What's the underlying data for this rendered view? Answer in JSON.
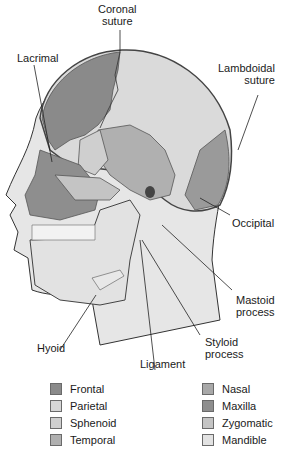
{
  "labels": {
    "coronal": "Coronal",
    "coronal2": "suture",
    "lacrimal": "Lacrimal",
    "lambdoidal": "Lambdoidal",
    "lambdoidal2": "suture",
    "occipital": "Occipital",
    "mastoid": "Mastoid",
    "mastoid2": "process",
    "hyoid": "Hyoid",
    "ligament": "Ligament",
    "styloid": "Styloid",
    "styloid2": "process"
  },
  "legend": {
    "left": [
      {
        "label": "Frontal",
        "color": "#8a8a8a"
      },
      {
        "label": "Parietal",
        "color": "#d6d6d6"
      },
      {
        "label": "Sphenoid",
        "color": "#cfcfcf"
      },
      {
        "label": "Temporal",
        "color": "#b0b0b0"
      }
    ],
    "right": [
      {
        "label": "Nasal",
        "color": "#a8a8a8"
      },
      {
        "label": "Maxilla",
        "color": "#8e8e8e"
      },
      {
        "label": "Zygomatic",
        "color": "#c4c4c4"
      },
      {
        "label": "Mandible",
        "color": "#e2e2e2"
      }
    ]
  }
}
